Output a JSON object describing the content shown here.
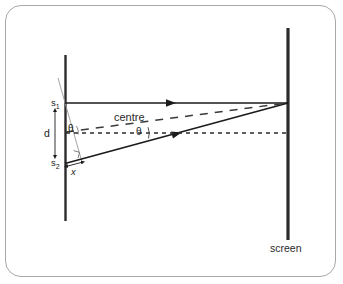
{
  "figure": {
    "kind": "optics-ray-diagram",
    "topic": "double-slit interference path difference",
    "frame": {
      "border_color": "#a8a8a8",
      "background_color": "#ffffff",
      "corner_radius_px": 16
    },
    "labels": {
      "slit_one": "s",
      "slit_one_sub": "1",
      "slit_two": "s",
      "slit_two_sub": "2",
      "slit_separation": "d",
      "angle_at_slits": "θ",
      "angle_at_centre": "θ",
      "path_difference": "x",
      "centre_line": "centre",
      "screen": "screen"
    },
    "colors": {
      "ray_solid": "#1b1b1b",
      "ray_dashed": "#2b2b2b",
      "barrier": "#2b2b2b",
      "screen_line": "#2b2b2b",
      "thin_construction": "#8a8a8a",
      "text": "#1b1b1b"
    },
    "geometry": {
      "barrier": {
        "x": 65,
        "y_top": 55,
        "y_bottom": 221,
        "width_px": 2.4
      },
      "screen": {
        "x": 288,
        "y_top": 28,
        "y_bottom": 240,
        "width_px": 3.0
      },
      "slit_one_point": {
        "x": 65,
        "y": 103
      },
      "slit_two_point": {
        "x": 65,
        "y": 163
      },
      "midpoint": {
        "x": 65,
        "y": 133
      },
      "convergence_point": {
        "x": 288,
        "y": 103
      }
    },
    "elements": [
      {
        "name": "upper-ray",
        "style": "solid",
        "from": "s1",
        "to": "screen-point",
        "arrow_at_x": 172
      },
      {
        "name": "lower-ray",
        "style": "solid",
        "from": "s2",
        "to": "screen-point",
        "arrow_at_x": 180
      },
      {
        "name": "centre-ray",
        "style": "dashed",
        "from": "midpoint",
        "to": "screen-point"
      },
      {
        "name": "axis-line",
        "style": "dashed",
        "from": "midpoint",
        "to": "screen-level"
      },
      {
        "name": "perpendicular-construction",
        "style": "thin-solid",
        "note": "wavefront normal from s1 meeting lower ray"
      },
      {
        "name": "right-angle-mark",
        "note": "square at foot of perpendicular on lower ray"
      },
      {
        "name": "d-dimension-arrow",
        "note": "double-headed vertical arrow between slits"
      },
      {
        "name": "x-dimension-arrow",
        "note": "double-headed arrow marking path difference"
      },
      {
        "name": "theta-arc-at-centre",
        "note": "arc between dashed centre ray and horizontal axis"
      }
    ]
  }
}
